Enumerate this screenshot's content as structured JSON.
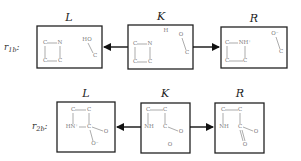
{
  "rules": [
    {
      "label": "r",
      "subscript": "1b",
      "colon": ":",
      "boxes": {
        "L": {
          "title": "L",
          "atoms": [
            "C",
            "N",
            "C",
            "C",
            "HO",
            "C"
          ]
        },
        "K": {
          "title": "K",
          "atoms": [
            "H",
            "C",
            "N",
            "C",
            "C",
            "O",
            "C"
          ]
        },
        "R": {
          "title": "R",
          "atoms": [
            "C",
            "NH⁺",
            "C",
            "C",
            "O⁻",
            "C"
          ]
        }
      },
      "arrows": [
        "K-to-L",
        "K-to-R"
      ]
    },
    {
      "label": "r",
      "subscript": "2b",
      "colon": ":",
      "boxes": {
        "L": {
          "title": "L",
          "atoms": [
            "C",
            "C",
            "HN⁺",
            "C",
            "O",
            "O⁻"
          ]
        },
        "K": {
          "title": "K",
          "atoms": [
            "C",
            "C",
            "NH",
            "C",
            "O",
            "O"
          ]
        },
        "R": {
          "title": "R",
          "atoms": [
            "C",
            "C",
            "NH",
            "C",
            "O",
            "O"
          ]
        }
      },
      "arrows": [
        "K-to-L",
        "K-to-R"
      ]
    }
  ]
}
